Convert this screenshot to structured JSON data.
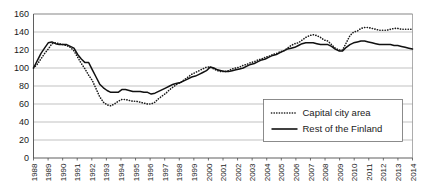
{
  "chart_data": {
    "type": "line",
    "title": "",
    "subtitle": "",
    "xlabel": "",
    "ylabel": "",
    "grid": "horizontal",
    "legend_position": "bottom-right",
    "xlim": [
      1988,
      2014.5
    ],
    "ylim": [
      0,
      160
    ],
    "ytick_step": 20,
    "yticks": [
      0,
      20,
      40,
      60,
      80,
      100,
      120,
      140,
      160
    ],
    "ytick_labels": [
      "0",
      "20",
      "40",
      "60",
      "80",
      "100",
      "120",
      "140",
      "160"
    ],
    "categories": [
      "1988",
      "1989",
      "1990",
      "1991",
      "1992",
      "1993",
      "1994",
      "1995",
      "1996",
      "1997",
      "1998",
      "1999",
      "2000",
      "2001",
      "2002",
      "2003",
      "2004",
      "2005",
      "2006",
      "2007",
      "2008",
      "2009",
      "2010",
      "2011",
      "2012",
      "2013",
      "2014"
    ],
    "x": [
      1988,
      1989,
      1990,
      1991,
      1992,
      1993,
      1994,
      1995,
      1996,
      1997,
      1998,
      1999,
      2000,
      2001,
      2002,
      2003,
      2004,
      2005,
      2006,
      2007,
      2008,
      2009,
      2010,
      2011,
      2012,
      2013,
      2014
    ],
    "series": [
      {
        "name": "Capital city area",
        "style": "dotted",
        "color": "#1a1a1a",
        "values": [
          100,
          121,
          126,
          112,
          86,
          59,
          65,
          63,
          60,
          72,
          84,
          95,
          101,
          96,
          101,
          107,
          113,
          119,
          128,
          137,
          130,
          120,
          141,
          145,
          142,
          144,
          143
        ],
        "quarterly_values": [
          100,
          104,
          110,
          116,
          121,
          127,
          128,
          127,
          126,
          125,
          123,
          119,
          112,
          105,
          99,
          92,
          86,
          77,
          68,
          62,
          59,
          58,
          60,
          63,
          65,
          65,
          64,
          63,
          63,
          62,
          61,
          60,
          60,
          62,
          66,
          69,
          72,
          76,
          79,
          82,
          84,
          87,
          90,
          93,
          95,
          97,
          99,
          101,
          101,
          99,
          97,
          96,
          96,
          97,
          99,
          100,
          101,
          103,
          104,
          106,
          107,
          109,
          110,
          112,
          113,
          115,
          116,
          118,
          119,
          122,
          125,
          127,
          128,
          131,
          134,
          136,
          137,
          136,
          134,
          131,
          130,
          126,
          122,
          120,
          120,
          128,
          136,
          140,
          141,
          144,
          145,
          145,
          144,
          143,
          142,
          142,
          142,
          143,
          144,
          144,
          143,
          143,
          143,
          143
        ]
      },
      {
        "name": "Rest of the Finland",
        "style": "solid",
        "color": "#111111",
        "values": [
          100,
          128,
          126,
          115,
          98,
          75,
          76,
          74,
          71,
          78,
          87,
          96,
          101,
          97,
          101,
          106,
          112,
          118,
          124,
          128,
          126,
          119,
          128,
          130,
          126,
          125,
          121
        ],
        "quarterly_values": [
          100,
          108,
          116,
          122,
          128,
          129,
          127,
          126,
          126,
          126,
          124,
          122,
          115,
          110,
          106,
          106,
          98,
          90,
          82,
          78,
          75,
          73,
          73,
          73,
          76,
          76,
          75,
          74,
          74,
          74,
          73,
          73,
          71,
          72,
          74,
          76,
          78,
          80,
          82,
          83,
          84,
          86,
          88,
          90,
          91,
          93,
          95,
          97,
          101,
          100,
          98,
          97,
          96,
          96,
          97,
          98,
          99,
          100,
          102,
          104,
          105,
          107,
          109,
          110,
          112,
          114,
          115,
          117,
          119,
          121,
          122,
          123,
          125,
          127,
          128,
          128,
          128,
          127,
          126,
          126,
          126,
          124,
          121,
          119,
          119,
          123,
          126,
          128,
          129,
          130,
          130,
          129,
          128,
          127,
          126,
          126,
          126,
          126,
          125,
          125,
          124,
          123,
          122,
          121
        ]
      }
    ],
    "legend": [
      {
        "label": "Capital city area",
        "style": "dotted"
      },
      {
        "label": "Rest of the Finland",
        "style": "solid"
      }
    ]
  }
}
